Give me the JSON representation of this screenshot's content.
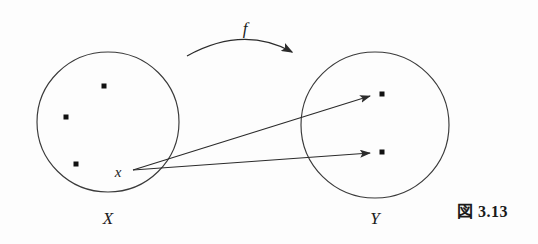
{
  "figure": {
    "caption": "図 3.13",
    "caption_number": "3.13",
    "caption_prefix": "図",
    "background_color": "#fdfdfd",
    "ink_color": "#2b2b2b",
    "width": 538,
    "height": 244
  },
  "labels": {
    "domain_set": "X",
    "codomain_set": "Y",
    "function": "f",
    "element": "x"
  },
  "diagram": {
    "type": "set-mapping-venn",
    "sets": [
      {
        "name": "X",
        "label": "X",
        "label_x": 108,
        "label_y": 220,
        "center_x": 108,
        "center_y": 122,
        "radius": 70,
        "elements": [
          {
            "name": "dot-x-1",
            "x": 104,
            "y": 86
          },
          {
            "name": "dot-x-2",
            "x": 66,
            "y": 117
          },
          {
            "name": "dot-x-3",
            "x": 76,
            "y": 164
          },
          {
            "name": "dot-x-labeled",
            "x": 133,
            "y": 170,
            "label": "x"
          }
        ]
      },
      {
        "name": "Y",
        "label": "Y",
        "label_x": 375,
        "label_y": 220,
        "center_x": 375,
        "center_y": 125,
        "radius": 74,
        "elements": [
          {
            "name": "dot-y-1",
            "x": 382,
            "y": 94
          },
          {
            "name": "dot-y-2",
            "x": 382,
            "y": 152
          }
        ]
      }
    ],
    "element_label": {
      "text": "x",
      "x": 118,
      "y": 176
    },
    "function_arc": {
      "label": "f",
      "label_x": 245,
      "label_y": 33,
      "path": "M 187 55 Q 243 26 295 54",
      "arrow_tip_x": 297,
      "arrow_tip_y": 58,
      "arrow_angle_deg": 35
    },
    "mapping_arrows": [
      {
        "name": "arrow-x-to-y1",
        "from_x": 133,
        "from_y": 170,
        "to_x": 374,
        "to_y": 95,
        "target": "dot-y-1"
      },
      {
        "name": "arrow-x-to-y2",
        "from_x": 133,
        "from_y": 170,
        "to_x": 374,
        "to_y": 153,
        "target": "dot-y-2"
      }
    ],
    "dot_size": 5
  }
}
